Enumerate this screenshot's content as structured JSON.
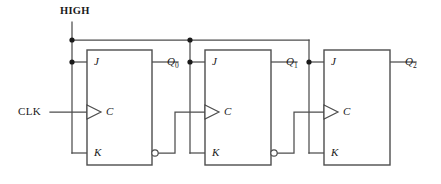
{
  "diagram": {
    "supply_label": "HIGH",
    "clock_label": "CLK",
    "colors": {
      "wire": "#4d4d4d",
      "box_outline": "#4d4d4d",
      "junction_dot": "#1a1a1a",
      "text": "#1a1a1a",
      "background": "#ffffff"
    },
    "pins": {
      "j": "J",
      "k": "K",
      "c": "C"
    },
    "flipflops": [
      {
        "name": "FF0",
        "j": "J",
        "k": "K",
        "clock": "C",
        "output_label": "Q",
        "output_index": "0"
      },
      {
        "name": "FF1",
        "j": "J",
        "k": "K",
        "clock": "C",
        "output_label": "Q",
        "output_index": "1"
      },
      {
        "name": "FF2",
        "j": "J",
        "k": "K",
        "clock": "C",
        "output_label": "Q",
        "output_index": "2"
      }
    ],
    "outputs": [
      {
        "label": "Q",
        "index": "0"
      },
      {
        "label": "Q",
        "index": "1"
      },
      {
        "label": "Q",
        "index": "2"
      }
    ]
  }
}
